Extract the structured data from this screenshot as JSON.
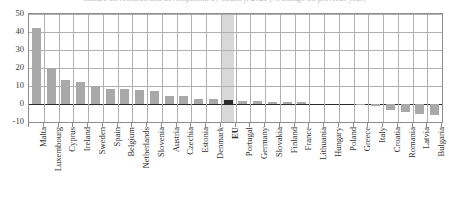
{
  "title_sliver": "nditure on research and development, by country, 2021 (% change on previous year)",
  "chart_data": {
    "type": "bar",
    "title": "",
    "xlabel": "",
    "ylabel": "",
    "ylim": [
      -10,
      50
    ],
    "yticks": [
      50,
      40,
      30,
      20,
      10,
      0,
      -10
    ],
    "ytick_labels": [
      "50",
      "40",
      "30",
      "20",
      "10",
      "0",
      "-10"
    ],
    "grid": true,
    "legend": "none",
    "highlight_category": "EU",
    "categories": [
      "Malta",
      "Luxembourg",
      "Cyprus",
      "Ireland",
      "Sweden",
      "Spain",
      "Belgium",
      "Netherlands",
      "Slovenia",
      "Austria",
      "Czechia",
      "Estonia",
      "Denmark",
      "EU",
      "Portugal",
      "Germany",
      "Slovakia",
      "Finland",
      "France",
      "Lithuania",
      "Hungary",
      "Poland",
      "Greece",
      "Italy",
      "Croatia",
      "Romania",
      "Latvia",
      "Bulgaria"
    ],
    "values": [
      42.0,
      20.0,
      13.5,
      12.0,
      10.0,
      8.5,
      8.5,
      7.6,
      7.3,
      4.7,
      4.5,
      2.8,
      2.8,
      2.3,
      1.4,
      1.4,
      1.1,
      1.1,
      1.0,
      0.0,
      0.0,
      0.0,
      -0.7,
      -1.2,
      -3.5,
      -4.6,
      -5.5,
      -6.2
    ],
    "series": [
      {
        "name": "annual change",
        "values": [
          42.0,
          20.0,
          13.5,
          12.0,
          10.0,
          8.5,
          8.5,
          7.6,
          7.3,
          4.7,
          4.5,
          2.8,
          2.8,
          2.3,
          1.4,
          1.4,
          1.1,
          1.1,
          1.0,
          0.0,
          0.0,
          0.0,
          -0.7,
          -1.2,
          -3.5,
          -4.6,
          -5.5,
          -6.2
        ]
      }
    ]
  },
  "colors": {
    "bar": "#a9a9a9",
    "bar_highlight": "#2b2b2b",
    "band_highlight": "#d8d8d8",
    "gridline": "#b0b0b0",
    "axis": "#8d8d8d",
    "zero_line": "#2b2b2b",
    "text": "#2f2f2f",
    "background": "#ffffff"
  }
}
